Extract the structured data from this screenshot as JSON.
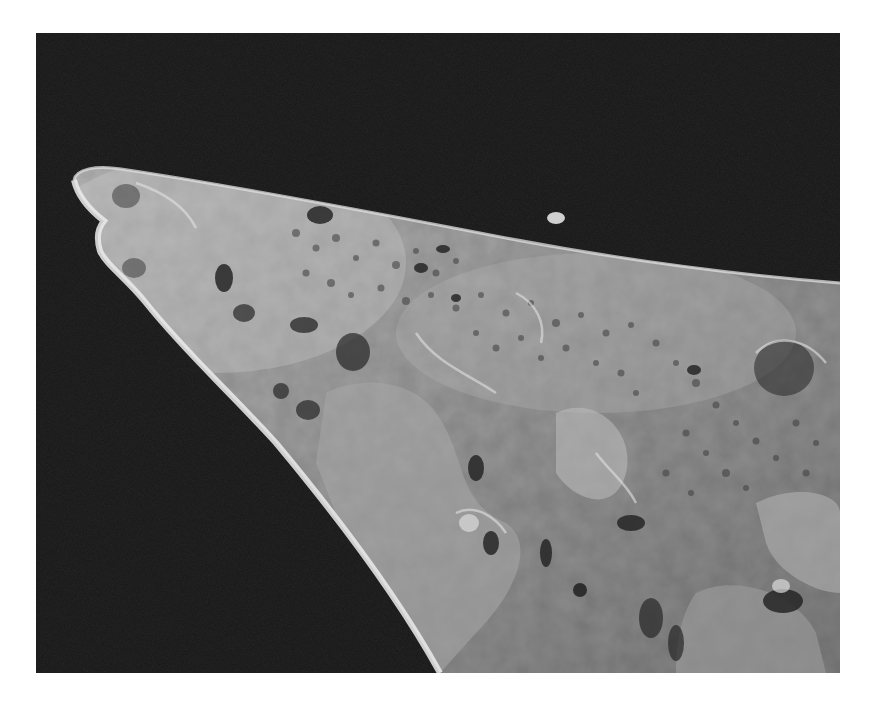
{
  "image": {
    "kind": "scanning electron micrograph",
    "subject": "pointed specimen tip with porous, pitted surface",
    "palette": {
      "page_background": "#ffffff",
      "frame_background": "#141414",
      "specimen_mid": "#8e8e8e",
      "specimen_light": "#c4c4c4",
      "edge_highlight": "#e6e6e6",
      "pore_dark": "#2a2a2a"
    },
    "frame": {
      "x": 36,
      "y": 33,
      "width": 804,
      "height": 640
    }
  }
}
